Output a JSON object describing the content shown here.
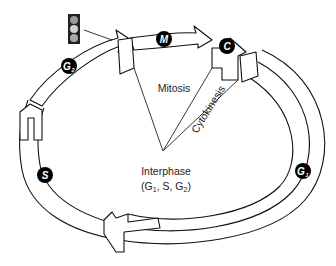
{
  "diagram": {
    "phases": {
      "mitosis": "Mitosis",
      "cytokinesis": "Cytokinesis",
      "interphase": "Interphase",
      "interphase_sub_prefix": "(G",
      "interphase_sub_1": "1",
      "interphase_sub_mid": ", S, G",
      "interphase_sub_2": "2",
      "interphase_sub_suffix": ")"
    },
    "badges": {
      "m": "M",
      "c": "C",
      "g2": "G",
      "g2_sub": "2",
      "s": "S",
      "g1": "G",
      "g1_sub": "1"
    },
    "traffic_light": {
      "lights": [
        "top",
        "middle",
        "bottom"
      ],
      "colors": [
        "#9a9a9a",
        "#d0d0d0",
        "#a8a8a8"
      ],
      "housing_color": "#222222"
    }
  }
}
